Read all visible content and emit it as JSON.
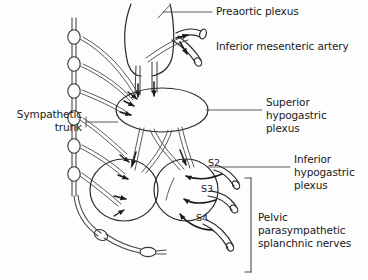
{
  "figure": {
    "background_color": "#fdfdfd",
    "ink_color": "#1a1a1a",
    "stroke_color": "#3a3a3a"
  },
  "labels": {
    "preaortic_plexus": "Preaortic plexus",
    "inferior_mesenteric_artery": "Inferior mesenteric artery",
    "superior_hypogastric_plexus": "Superior hypogastric\nplexus",
    "inferior_hypogastric_plexus": "Inferior hypogastric\nplexus",
    "sympathetic_trunk": "Sympathetic\ntrunk",
    "pelvic_splanchnic_nerves": "Pelvic parasympathetic\nsplanchnic nerves"
  },
  "nerve_roots": {
    "s2": "S2",
    "s3": "S3",
    "s4": "S4"
  },
  "structures": {
    "sympathetic_trunk_ganglia_count": 6,
    "ganglion_impar": "ganglion impar",
    "preaortic_plexus_shape": "vertical-oval",
    "superior_hypogastric_plexus_shape": "horizontal-oval",
    "inferior_hypogastric_plexus_count": 2,
    "sacral_splanchnic_roots": 3
  }
}
